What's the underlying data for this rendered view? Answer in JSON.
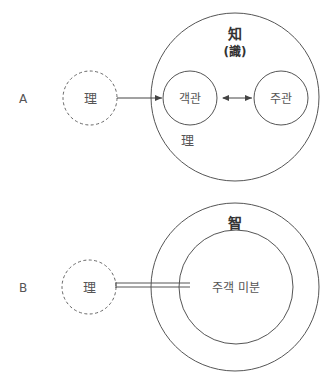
{
  "diagram_a": {
    "row_label": "A",
    "source_circle": {
      "label": "理",
      "style": "dashed"
    },
    "outer_circle": {
      "title": "知",
      "subtitle": "(識)",
      "inner_label": "理"
    },
    "object_circle": {
      "label": "객관"
    },
    "subject_circle": {
      "label": "주관"
    },
    "connections": [
      {
        "from": "source_circle",
        "to": "object_circle",
        "type": "single-arrow"
      },
      {
        "from": "object_circle",
        "to": "subject_circle",
        "type": "double-arrow"
      }
    ]
  },
  "diagram_b": {
    "row_label": "B",
    "source_circle": {
      "label": "理",
      "style": "dashed"
    },
    "outer_circle": {
      "title": "智"
    },
    "inner_circle": {
      "label": "주객 미분"
    },
    "connections": [
      {
        "from": "source_circle",
        "to": "inner_circle",
        "type": "double-line"
      }
    ]
  },
  "colors": {
    "stroke": "#555555",
    "text": "#555555",
    "title": "#333333",
    "background": "#ffffff"
  }
}
